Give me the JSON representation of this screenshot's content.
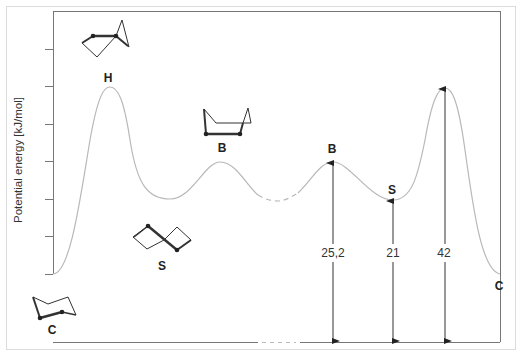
{
  "diagram": {
    "title": "",
    "y_axis_label": "Potential energy [kJ/mol]",
    "conformations": [
      {
        "id": "C-left",
        "label": "C",
        "name": "chair"
      },
      {
        "id": "H-left",
        "label": "H",
        "name": "half-chair"
      },
      {
        "id": "S-left",
        "label": "S",
        "name": "twist-boat"
      },
      {
        "id": "B-left",
        "label": "B",
        "name": "boat"
      },
      {
        "id": "B-right",
        "label": "B",
        "name": "boat"
      },
      {
        "id": "S-right",
        "label": "S",
        "name": "twist-boat"
      },
      {
        "id": "C-right",
        "label": "C",
        "name": "chair"
      }
    ],
    "energy_values": [
      {
        "label": "25,2",
        "from": "C",
        "to": "B"
      },
      {
        "label": "21",
        "from": "C",
        "to": "S"
      },
      {
        "label": "42",
        "from": "C",
        "to": "H"
      }
    ],
    "colors": {
      "curve": "#b8b8b8",
      "axis": "#666666",
      "arrow": "#333333",
      "frame": "#dddddd",
      "molecule": "#333333"
    }
  }
}
